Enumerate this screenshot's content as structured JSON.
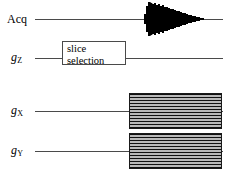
{
  "diagram": {
    "type": "pulse-sequence",
    "width": 234,
    "height": 174,
    "background_color": "#ffffff",
    "line_color": "#4a4a4a",
    "hatch_color": "#111111",
    "hatch_fill_color": "#b9b9b9"
  },
  "channels": [
    {
      "id": "acq",
      "label": "Acq",
      "label_glyph": "Acq",
      "label_sub": "",
      "baseline_y": 19,
      "baseline_x": 35,
      "baseline_width": 188
    },
    {
      "id": "gz",
      "label": "gZ",
      "label_glyph": "g",
      "label_sub": "Z",
      "baseline_y": 58,
      "baseline_x": 35,
      "baseline_width": 188
    },
    {
      "id": "gx",
      "label": "gX",
      "label_glyph": "g",
      "label_sub": "X",
      "baseline_y": 111,
      "baseline_x": 35,
      "baseline_width": 188
    },
    {
      "id": "gy",
      "label": "gY",
      "label_glyph": "g",
      "label_sub": "Y",
      "baseline_y": 151,
      "baseline_x": 35,
      "baseline_width": 188
    }
  ],
  "slice_selection_box": {
    "line_1": "slice",
    "line_2": "selection",
    "x": 62,
    "y": 41,
    "width": 64,
    "height": 24
  },
  "gradient_blocks": [
    {
      "channel": "gx",
      "x": 129,
      "y": 93,
      "width": 93,
      "height": 36
    },
    {
      "channel": "gy",
      "x": 129,
      "y": 133,
      "width": 93,
      "height": 36
    }
  ],
  "acquisition_signal": {
    "name": "free-induction-decay",
    "x": 144,
    "y": 1,
    "width": 68,
    "height": 36,
    "center_y": 18,
    "peak_amplitude": 17,
    "oscillation_count": 13,
    "decay_shape": "triangular-envelope"
  }
}
